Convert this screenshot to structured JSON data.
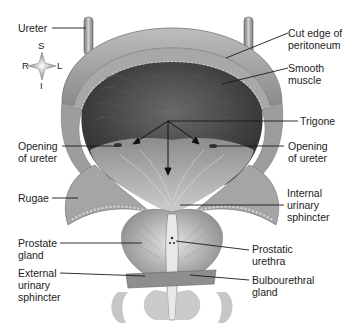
{
  "diagram": {
    "colors": {
      "text": "#222222",
      "leader": "#1a1a1a",
      "tissue_light": "#cfcfcf",
      "tissue_mid": "#9a9a9a",
      "tissue_dark": "#4a4a4a",
      "lumen": "#3a3a3a"
    },
    "compass": {
      "superior": "S",
      "inferior": "I",
      "right": "R",
      "left": "L"
    },
    "labels": {
      "ureter": "Ureter",
      "cut_edge": "Cut edge of\nperitoneum",
      "smooth_muscle": "Smooth\nmuscle",
      "trigone": "Trigone",
      "opening_left": "Opening\nof ureter",
      "opening_right": "Opening\nof ureter",
      "rugae": "Rugae",
      "internal_sphincter": "Internal\nurinary\nsphincter",
      "prostate": "Prostate\ngland",
      "prostatic_urethra": "Prostatic\nurethra",
      "external_sphincter": "External\nurinary\nsphincter",
      "bulbourethral": "Bulbourethral\ngland"
    }
  }
}
